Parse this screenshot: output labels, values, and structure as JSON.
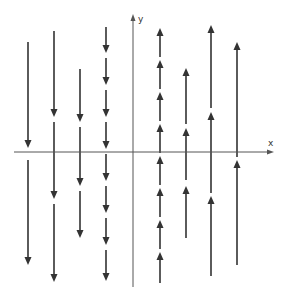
{
  "figure": {
    "axes": {
      "x_label": "x",
      "y_label": "y",
      "x_axis": {
        "y": 152,
        "x_start": 14,
        "x_end": 274
      },
      "y_axis": {
        "x": 133,
        "y_start": 287,
        "y_end": 14
      }
    },
    "colors": {
      "stroke": "#333333",
      "axis": "#555555",
      "background": "#ffffff"
    },
    "columns": [
      {
        "x": 28,
        "direction": "down",
        "segments": [
          [
            42,
            148
          ],
          [
            160,
            265
          ]
        ]
      },
      {
        "x": 54,
        "direction": "down",
        "segments": [
          [
            31,
            117
          ],
          [
            122,
            199
          ],
          [
            204,
            282
          ]
        ]
      },
      {
        "x": 80,
        "direction": "down",
        "segments": [
          [
            69,
            122
          ],
          [
            127,
            186
          ],
          [
            191,
            238
          ]
        ]
      },
      {
        "x": 106,
        "direction": "down",
        "segments": [
          [
            27,
            53
          ],
          [
            58,
            85
          ],
          [
            90,
            117
          ],
          [
            122,
            149
          ],
          [
            154,
            181
          ],
          [
            186,
            213
          ],
          [
            218,
            245
          ],
          [
            250,
            281
          ]
        ]
      },
      {
        "x": 160,
        "direction": "up",
        "segments": [
          [
            28,
            57
          ],
          [
            60,
            89
          ],
          [
            92,
            121
          ],
          [
            124,
            153
          ],
          [
            156,
            185
          ],
          [
            188,
            217
          ],
          [
            220,
            249
          ],
          [
            252,
            283
          ]
        ]
      },
      {
        "x": 186,
        "direction": "up",
        "segments": [
          [
            68,
            124
          ],
          [
            128,
            180
          ],
          [
            186,
            238
          ]
        ]
      },
      {
        "x": 211,
        "direction": "up",
        "segments": [
          [
            25,
            108
          ],
          [
            112,
            193
          ],
          [
            196,
            276
          ]
        ]
      },
      {
        "x": 237,
        "direction": "up",
        "segments": [
          [
            42,
            157
          ],
          [
            160,
            265
          ]
        ]
      }
    ]
  }
}
